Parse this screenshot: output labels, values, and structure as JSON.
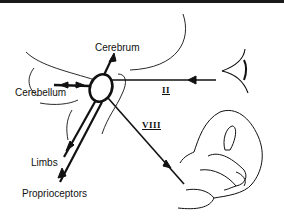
{
  "diagram": {
    "labels": {
      "cerebrum": "Cerebrum",
      "cerebellum": "Cerebellum",
      "limbs": "Limbs",
      "proprioceptors": "Proprioceptors",
      "optic_nerve": "II",
      "vestibular_nerve": "VIII"
    },
    "nodes": [
      {
        "id": "vestibular-nuclei",
        "shape": "ellipse"
      },
      {
        "id": "eye",
        "shape": "eye-drawing"
      },
      {
        "id": "inner-ear",
        "shape": "labyrinth-drawing"
      }
    ],
    "edges": [
      {
        "from": "eye",
        "to": "vestibular-nuclei",
        "label": "II",
        "direction": "toward-center"
      },
      {
        "from": "inner-ear",
        "to": "vestibular-nuclei",
        "label": "VIII",
        "direction": "toward-center"
      },
      {
        "from": "vestibular-nuclei",
        "to": "cerebrum",
        "label": "",
        "direction": "bidirectional"
      },
      {
        "from": "vestibular-nuclei",
        "to": "cerebellum",
        "label": "",
        "direction": "bidirectional"
      },
      {
        "from": "vestibular-nuclei",
        "to": "limbs",
        "label": "",
        "direction": "outward"
      },
      {
        "from": "proprioceptors",
        "to": "vestibular-nuclei",
        "label": "",
        "direction": "toward-center"
      }
    ],
    "colors": {
      "ink": "#111111",
      "background": "#ffffff"
    }
  }
}
